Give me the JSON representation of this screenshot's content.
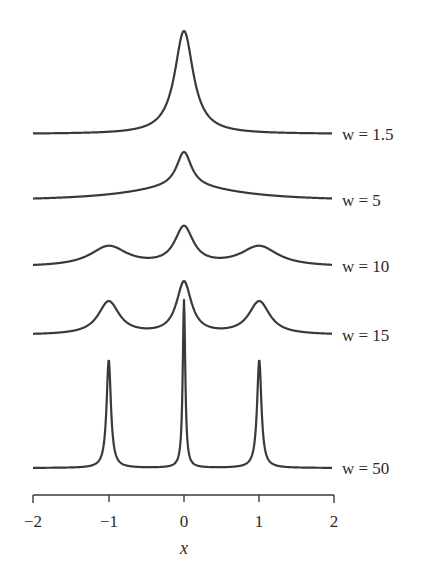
{
  "chart_data": {
    "type": "line",
    "title": "",
    "xlabel": "x",
    "ylabel": "",
    "xlim": [
      -2,
      2
    ],
    "x_ticks": [
      -2,
      -1,
      0,
      1,
      2
    ],
    "x_tick_labels": [
      "−2",
      "−1",
      "0",
      "1",
      "2"
    ],
    "grid": false,
    "legend": "inline labels at right end of each curve",
    "layout": "vertically offset stacked curves, no y-axis",
    "series": [
      {
        "name": "w = 1.5",
        "label": "w = 1.5",
        "baseline_px": 134,
        "peaks": [
          {
            "x": 0,
            "height_px": 103,
            "width": 0.15
          }
        ]
      },
      {
        "name": "w = 5",
        "label": "w = 5",
        "baseline_px": 201,
        "peaks": [
          {
            "x": 0,
            "height_px": 35,
            "width": 0.12
          },
          {
            "x": 0,
            "height_px": 14,
            "width": 0.9
          }
        ]
      },
      {
        "name": "w = 10",
        "label": "w = 10",
        "baseline_px": 267,
        "peaks": [
          {
            "x": -1,
            "height_px": 20,
            "width": 0.3
          },
          {
            "x": 0,
            "height_px": 38,
            "width": 0.15
          },
          {
            "x": 1,
            "height_px": 20,
            "width": 0.3
          }
        ]
      },
      {
        "name": "w = 15",
        "label": "w = 15",
        "baseline_px": 335,
        "peaks": [
          {
            "x": -1,
            "height_px": 33,
            "width": 0.17
          },
          {
            "x": 0,
            "height_px": 52,
            "width": 0.12
          },
          {
            "x": 1,
            "height_px": 33,
            "width": 0.17
          }
        ]
      },
      {
        "name": "w = 50",
        "label": "w = 50",
        "baseline_px": 468,
        "peaks": [
          {
            "x": -1,
            "height_px": 108,
            "width": 0.035
          },
          {
            "x": 0,
            "height_px": 168,
            "width": 0.02
          },
          {
            "x": 1,
            "height_px": 108,
            "width": 0.035
          }
        ]
      }
    ]
  },
  "labels": {
    "w15": "w = 1.5",
    "w5": "w = 5",
    "w10": "w = 10",
    "w15b": "w = 15",
    "w50": "w = 50",
    "xlabel": "x",
    "ticks": [
      "−2",
      "−1",
      "0",
      "1",
      "2"
    ]
  }
}
